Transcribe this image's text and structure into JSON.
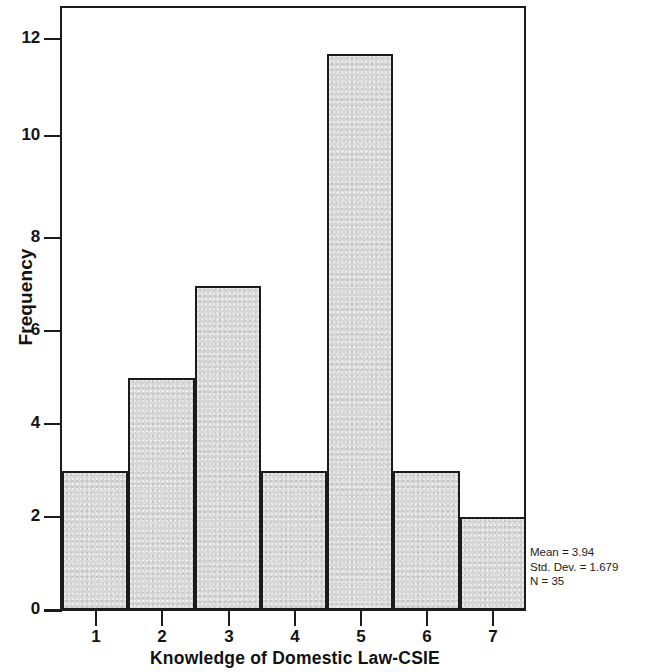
{
  "chart_data": {
    "type": "bar",
    "title": "",
    "subtitle": "",
    "xlabel": "Knowledge of Domestic Law-CSIE",
    "ylabel": "Frequency",
    "categories": [
      "1",
      "2",
      "3",
      "4",
      "5",
      "6",
      "7"
    ],
    "values": [
      3,
      5,
      7,
      3,
      12,
      3,
      2
    ],
    "xlim": [
      0.5,
      7.5
    ],
    "ylim": [
      0,
      13
    ],
    "x_ticks": [
      "1",
      "2",
      "3",
      "4",
      "5",
      "6",
      "7"
    ],
    "y_ticks": [
      "0",
      "2",
      "4",
      "6",
      "8",
      "10",
      "12"
    ],
    "y_tick_values": [
      0,
      2,
      4,
      6,
      8,
      10,
      12
    ],
    "grid": false,
    "legend": null,
    "bar_fill_color": "#d6d6d6",
    "bar_edge_color": "#1b1b1b",
    "background_color": "#ffffff",
    "annotations": [
      "Mean = 3.94",
      "Std. Dev. = 1.679",
      "N = 35"
    ]
  },
  "stats": {
    "mean": "Mean = 3.94",
    "std_dev": "Std. Dev. = 1.679",
    "n": "N = 35"
  },
  "axes": {
    "y_title": "Frequency",
    "x_title": "Knowledge of Domestic Law-CSIE"
  }
}
